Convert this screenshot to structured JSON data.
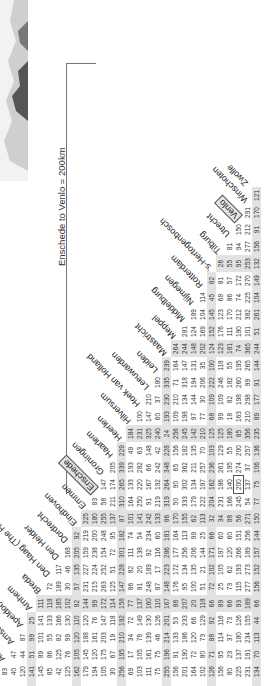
{
  "scale_note": "Enschede to Venlo = 200km",
  "cities": [
    "Alkmaar",
    "Amersfoort",
    "Amsterdam",
    "Apeldoorn",
    "Arnhem",
    "Breda",
    "Den Haag (The Hague)",
    "Den Helder",
    "Dordrecht",
    "Eindhoven",
    "Emmen",
    "Enschede",
    "Groningen",
    "Haarlem",
    "Heerlen",
    "Hilversum",
    "Hoek van Holland",
    "Leeuwarden",
    "Leiden",
    "Maastricht",
    "Meppel",
    "Middelburg",
    "Nijmegen",
    "Rotterdam",
    "'s-Hertogenbosch",
    "Tilburg",
    "Utrecht",
    "Venlo",
    "Winschoten",
    "Zwolle"
  ],
  "highlighted_cities": [
    "Enschede",
    "Venlo"
  ],
  "highlighted_cell": {
    "row": "Venlo",
    "col": "Enschede",
    "value": 200
  },
  "band_every": 5,
  "rows": [
    {
      "city": "Amersfoort",
      "values": [
        83
      ]
    },
    {
      "city": "Amsterdam",
      "values": [
        40,
        47
      ]
    },
    {
      "city": "Apeldoorn",
      "values": [
        120,
        44,
        87
      ]
    },
    {
      "city": "Arnhem",
      "values": [
        141,
        51,
        99,
        25
      ]
    },
    {
      "city": "Breda",
      "values": [
        145,
        89,
        101,
        141,
        111
      ]
    },
    {
      "city": "Den Haag (The Hague)",
      "values": [
        85,
        86,
        55,
        133,
        118,
        72
      ]
    },
    {
      "city": "Den Helder",
      "values": [
        42,
        125,
        82,
        166,
        185,
        189,
        117
      ]
    },
    {
      "city": "Dordrecht",
      "values": [
        125,
        76,
        99,
        130,
        102,
        30,
        46,
        168
      ]
    },
    {
      "city": "Eindhoven",
      "values": [
        162,
        105,
        120,
        110,
        82,
        57,
        135,
        205,
        92
      ]
    },
    {
      "city": "Emmen",
      "values": [
        179,
        145,
        188,
        120,
        144,
        231,
        227,
        159,
        219,
        225
      ]
    },
    {
      "city": "Enschede",
      "values": [
        194,
        120,
        161,
        76,
        99,
        215,
        224,
        238,
        200,
        180,
        83
      ]
    },
    {
      "city": "Groningen",
      "values": [
        105,
        175,
        203,
        147,
        172,
        263,
        252,
        154,
        248,
        255,
        58,
        147
      ]
    },
    {
      "city": "Haarlem",
      "values": [
        30,
        67,
        19,
        118,
        114,
        125,
        51,
        72,
        95,
        137,
        211,
        174,
        205
      ]
    },
    {
      "city": "Heerlen",
      "values": [
        256,
        195,
        210,
        192,
        158,
        147,
        228,
        301,
        182,
        87,
        310,
        265,
        339,
        229
      ]
    },
    {
      "city": "Hilversum",
      "values": [
        69,
        17,
        34,
        72,
        77,
        86,
        82,
        111,
        74,
        101,
        164,
        133,
        193,
        49,
        184
      ]
    },
    {
      "city": "Hoek van Holland",
      "values": [
        103,
        105,
        78,
        149,
        137,
        81,
        20,
        138,
        54,
        141,
        250,
        220,
        282,
        63,
        231,
        100
      ]
    },
    {
      "city": "Leeuwarden",
      "values": [
        111,
        161,
        139,
        130,
        160,
        248,
        189,
        92,
        234,
        242,
        91,
        167,
        66,
        148,
        325,
        147,
        210
      ]
    },
    {
      "city": "Leiden",
      "values": [
        75,
        75,
        46,
        126,
        110,
        87,
        17,
        116,
        60,
        133,
        219,
        192,
        242,
        42,
        240,
        60,
        37,
        180
      ]
    },
    {
      "city": "Maastricht",
      "values": [
        255,
        196,
        214,
        201,
        167,
        148,
        223,
        286,
        181,
        86,
        319,
        264,
        348,
        228,
        24,
        193,
        230,
        335,
        239
      ]
    },
    {
      "city": "Meppel",
      "values": [
        156,
        91,
        133,
        53,
        88,
        176,
        172,
        177,
        164,
        170,
        50,
        90,
        65,
        156,
        256,
        109,
        210,
        71,
        164,
        264
      ]
    },
    {
      "city": "Middelburg",
      "values": [
        201,
        190,
        186,
        233,
        207,
        95,
        134,
        256,
        113,
        155,
        333,
        302,
        362,
        182,
        245,
        198,
        134,
        318,
        147,
        244,
        281
      ]
    },
    {
      "city": "Nijmegen",
      "values": [
        164,
        72,
        120,
        66,
        20,
        100,
        135,
        206,
        99,
        62,
        179,
        134,
        211,
        135,
        142,
        97,
        144,
        194,
        131,
        148,
        124,
        189
      ]
    },
    {
      "city": "Rotterdam",
      "values": [
        102,
        80,
        73,
        129,
        118,
        51,
        21,
        144,
        25,
        113,
        222,
        197,
        257,
        70,
        210,
        77,
        30,
        206,
        35,
        202,
        169,
        104,
        114
      ]
    },
    {
      "city": "'s-Hertogenbosch",
      "values": [
        126,
        71,
        88,
        92,
        66,
        72,
        102,
        171,
        66,
        32,
        204,
        162,
        236,
        103,
        125,
        68,
        109,
        222,
        100,
        124,
        152,
        145,
        45,
        82
      ]
    },
    {
      "city": "Tilburg",
      "values": [
        156,
        95,
        114,
        116,
        89,
        25,
        105,
        197,
        60,
        34,
        231,
        186,
        261,
        129,
        125,
        99,
        109,
        246,
        118,
        123,
        176,
        123,
        68,
        81,
        26
      ]
    },
    {
      "city": "Utrecht",
      "values": [
        80,
        23,
        37,
        73,
        66,
        73,
        62,
        120,
        60,
        88,
        166,
        140,
        195,
        55,
        180,
        18,
        82,
        182,
        55,
        181,
        111,
        170,
        86,
        57,
        55,
        81
      ]
    },
    {
      "city": "Venlo",
      "values": [
        225,
        137,
        180,
        126,
        93,
        115,
        193,
        266,
        151,
        56,
        245,
        200,
        274,
        200,
        85,
        163,
        198,
        260,
        195,
        74,
        190,
        212,
        74,
        172,
        95,
        94,
        150
      ]
    },
    {
      "city": "Winschoten",
      "values": [
        231,
        191,
        234,
        155,
        189,
        277,
        273,
        189,
        256,
        271,
        54,
        137,
        37,
        257,
        356,
        210,
        298,
        99,
        265,
        365,
        101,
        382,
        225,
        270,
        253,
        277,
        212,
        291
      ]
    },
    {
      "city": "Zwolle",
      "values": [
        134,
        70,
        113,
        44,
        66,
        156,
        152,
        157,
        144,
        150,
        77,
        75,
        106,
        136,
        235,
        89,
        177,
        91,
        144,
        244,
        51,
        261,
        104,
        149,
        132,
        156,
        91,
        170,
        121
      ]
    }
  ]
}
